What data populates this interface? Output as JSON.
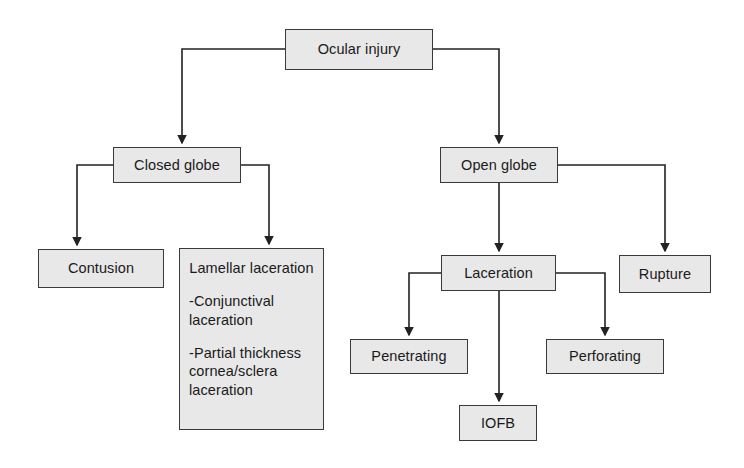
{
  "diagram": {
    "type": "flowchart",
    "background_color": "#ffffff",
    "node_fill_color": "#e8e8e8",
    "node_border_color": "#3a3a3a",
    "edge_color": "#222222",
    "nodes": [
      {
        "id": "ocular_injury",
        "label": "Ocular injury",
        "x": 285,
        "y": 29,
        "w": 148,
        "h": 41,
        "level": 0
      },
      {
        "id": "closed_globe",
        "label": "Closed globe",
        "x": 113,
        "y": 147,
        "w": 128,
        "h": 36,
        "level": 1
      },
      {
        "id": "open_globe",
        "label": "Open globe",
        "x": 440,
        "y": 147,
        "w": 118,
        "h": 36,
        "level": 1
      },
      {
        "id": "contusion",
        "label": "Contusion",
        "x": 38,
        "y": 249,
        "w": 126,
        "h": 39,
        "level": 2
      },
      {
        "id": "lamellar_laceration",
        "title": "Lamellar laceration",
        "bullets": [
          "-Conjunctival laceration",
          "-Partial thickness cornea/sclera laceration"
        ],
        "x": 179,
        "y": 248,
        "w": 145,
        "h": 182,
        "level": 2
      },
      {
        "id": "laceration",
        "label": "Laceration",
        "x": 441,
        "y": 255,
        "w": 115,
        "h": 36,
        "level": 2
      },
      {
        "id": "rupture",
        "label": "Rupture",
        "x": 619,
        "y": 255,
        "w": 92,
        "h": 38,
        "level": 2
      },
      {
        "id": "penetrating",
        "label": "Penetrating",
        "x": 350,
        "y": 339,
        "w": 118,
        "h": 35,
        "level": 3
      },
      {
        "id": "perforating",
        "label": "Perforating",
        "x": 546,
        "y": 339,
        "w": 118,
        "h": 35,
        "level": 3
      },
      {
        "id": "iofb",
        "label": "IOFB",
        "x": 459,
        "y": 405,
        "w": 78,
        "h": 36,
        "level": 3
      }
    ],
    "edges": [
      {
        "from": "ocular_injury",
        "to": "closed_globe"
      },
      {
        "from": "ocular_injury",
        "to": "open_globe"
      },
      {
        "from": "closed_globe",
        "to": "contusion"
      },
      {
        "from": "closed_globe",
        "to": "lamellar_laceration"
      },
      {
        "from": "open_globe",
        "to": "laceration"
      },
      {
        "from": "open_globe",
        "to": "rupture"
      },
      {
        "from": "laceration",
        "to": "penetrating"
      },
      {
        "from": "laceration",
        "to": "iofb"
      },
      {
        "from": "laceration",
        "to": "perforating"
      }
    ]
  }
}
